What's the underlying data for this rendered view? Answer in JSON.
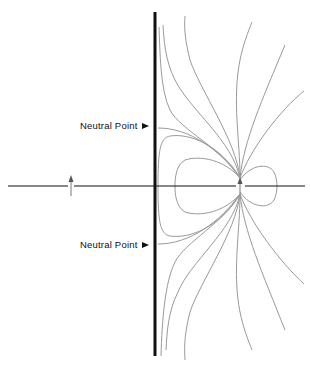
{
  "diagram": {
    "title": "",
    "labels": [
      {
        "id": "neutral-point-upper",
        "text": "Neutral Point",
        "x": 80,
        "y": 120
      },
      {
        "id": "neutral-point-lower",
        "text": "Neutral Point",
        "x": 80,
        "y": 239
      }
    ],
    "elements": {
      "conductor_plane": {
        "x": 155,
        "y_top": 12,
        "y_bottom": 356,
        "color": "#111111"
      },
      "axis": {
        "y": 186,
        "x_start": 8,
        "x_end": 305,
        "color": "#111111"
      },
      "image_dipole": {
        "x": 71,
        "y": 186,
        "direction": "up"
      },
      "real_dipole": {
        "x": 240,
        "y": 186,
        "direction": "up"
      }
    },
    "colors": {
      "field_lines": "#9a9a9a",
      "ink": "#111111",
      "background": "#ffffff"
    }
  }
}
